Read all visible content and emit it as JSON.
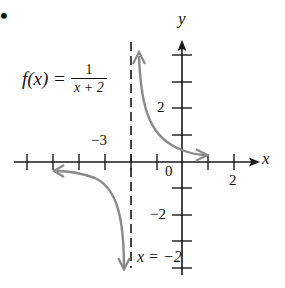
{
  "bullet": "•",
  "function_label": {
    "lhs": "f(x) =",
    "numerator": "1",
    "denominator": "x + 2"
  },
  "axes": {
    "x_label": "x",
    "y_label": "y",
    "origin_label": "0",
    "x_tick_labels": {
      "neg3": "−3",
      "pos2": "2"
    },
    "y_tick_labels": {
      "pos2": "2",
      "neg2": "−2"
    }
  },
  "asymptote": {
    "label": "x = −2",
    "x_value": -2,
    "style": "dashed"
  },
  "colors": {
    "curve": "#8a8a8a",
    "axes": "#1a1a1a",
    "asymptote": "#1a1a1a",
    "background": "#ffffff"
  },
  "graph": {
    "type": "function_plot",
    "function": "1/(x+2)",
    "x_range": [
      -6,
      2
    ],
    "y_range": [
      -4,
      4
    ],
    "branches": [
      {
        "name": "right-branch",
        "x_range": [
          -1.9,
          1
        ],
        "arrows": "both"
      },
      {
        "name": "left-branch",
        "x_range": [
          -5,
          -2.1
        ],
        "arrows": "both"
      }
    ]
  }
}
